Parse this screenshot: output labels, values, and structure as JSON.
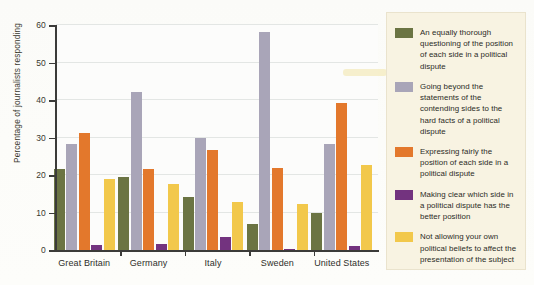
{
  "chart_data": {
    "type": "bar",
    "title": "",
    "xlabel": "",
    "ylabel": "Percentage of journalists responding",
    "ylim": [
      0,
      60
    ],
    "yticks": [
      0,
      10,
      20,
      30,
      40,
      50,
      60
    ],
    "ytick_labels": [
      "0",
      "10",
      "20",
      "30",
      "40",
      "50",
      "60"
    ],
    "grid": true,
    "legend_position": "right",
    "categories": [
      "Great Britain",
      "Germany",
      "Italy",
      "Sweden",
      "United States"
    ],
    "series": [
      {
        "name": "An equally thorough questioning of the position of each side in a political dispute",
        "color": "#6b7443",
        "values": [
          21.5,
          19.6,
          14.2,
          6.9,
          9.9
        ]
      },
      {
        "name": "Going beyond the statements of the contending sides to the hard facts of a political dispute",
        "color": "#a9a5b8",
        "values": [
          28.3,
          42.2,
          30.0,
          58.1,
          28.3
        ]
      },
      {
        "name": "Expressing fairly the position of each side in a political dispute",
        "color": "#e3782c",
        "values": [
          31.3,
          21.6,
          26.8,
          22.0,
          39.1
        ]
      },
      {
        "name": "Making clear which side in a political dispute has the better position",
        "color": "#73337f",
        "values": [
          1.4,
          1.7,
          3.6,
          0.4,
          1.0
        ]
      },
      {
        "name": "Not allowing your own political beliefs to affect the presentation of the subject",
        "color": "#f2c84b",
        "values": [
          19.0,
          17.6,
          12.7,
          12.2,
          22.6
        ]
      }
    ]
  },
  "legend": {
    "entries": [
      {
        "label": "An equally thorough questioning of the position of each side in a political dispute",
        "color": "#6b7443"
      },
      {
        "label": "Going beyond the statements of the contending sides to the hard facts of a political dispute",
        "color": "#a9a5b8"
      },
      {
        "label": "Expressing fairly the position of each side in a political dispute",
        "color": "#e3782c"
      },
      {
        "label": "Making clear which side in a political dispute has the better position",
        "color": "#73337f"
      },
      {
        "label": "Not allowing your own political beliefs to affect the presentation of the subject",
        "color": "#f2c84b"
      }
    ]
  }
}
